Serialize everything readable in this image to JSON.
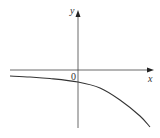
{
  "chart_data": {
    "type": "line",
    "title": "",
    "xlabel": "x",
    "ylabel": "y",
    "origin_label": "0",
    "grid": false,
    "legend": null,
    "series": [
      {
        "name": "curve",
        "points_px": [
          [
            10,
            76
          ],
          [
            30,
            77
          ],
          [
            50,
            78.5
          ],
          [
            78,
            82
          ],
          [
            100,
            88
          ],
          [
            120,
            100
          ],
          [
            140,
            116
          ],
          [
            150,
            127
          ]
        ]
      }
    ],
    "axes": {
      "x_axis_y_px": 70,
      "y_axis_x_px": 78,
      "x_range_px": [
        10,
        153
      ],
      "y_range_px": [
        10,
        128
      ]
    },
    "colors": {
      "axis": "#444444",
      "curve": "#333333",
      "text": "#333333"
    }
  }
}
